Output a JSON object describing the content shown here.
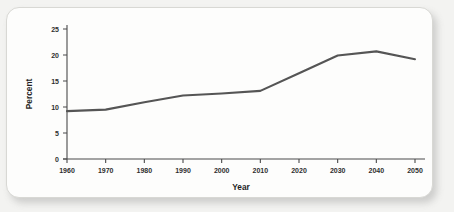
{
  "card": {
    "background_color": "#fdfdfc",
    "border_color": "#d8d8d4"
  },
  "chart_data": {
    "type": "line",
    "title": "",
    "subtitle": "",
    "xlabel": "Year",
    "ylabel": "Percent",
    "x": [
      1960,
      1970,
      1980,
      1990,
      2000,
      2010,
      2020,
      2030,
      2040,
      2050
    ],
    "values": [
      9.2,
      9.5,
      10.9,
      12.2,
      12.6,
      13.1,
      16.5,
      19.9,
      20.7,
      19.2
    ],
    "series": [
      {
        "name": "Percent",
        "values": [
          9.2,
          9.5,
          10.9,
          12.2,
          12.6,
          13.1,
          16.5,
          19.9,
          20.7,
          19.2
        ],
        "color": "#555555"
      }
    ],
    "xlim": [
      1960,
      2050
    ],
    "ylim": [
      0,
      25
    ],
    "xticks": [
      1960,
      1970,
      1980,
      1990,
      2000,
      2010,
      2020,
      2030,
      2040,
      2050
    ],
    "xtick_labels": [
      "1960",
      "1970",
      "1980",
      "1990",
      "2000",
      "2010",
      "2020",
      "2030",
      "2040",
      "2050"
    ],
    "yticks": [
      0,
      5,
      10,
      15,
      20,
      25
    ],
    "ytick_labels": [
      "0",
      "5",
      "10",
      "15",
      "20",
      "25"
    ],
    "grid": false,
    "legend": false,
    "legend_position": "none",
    "line_color": "#555555",
    "axis_color": "#4a4a4a",
    "annotations": []
  }
}
